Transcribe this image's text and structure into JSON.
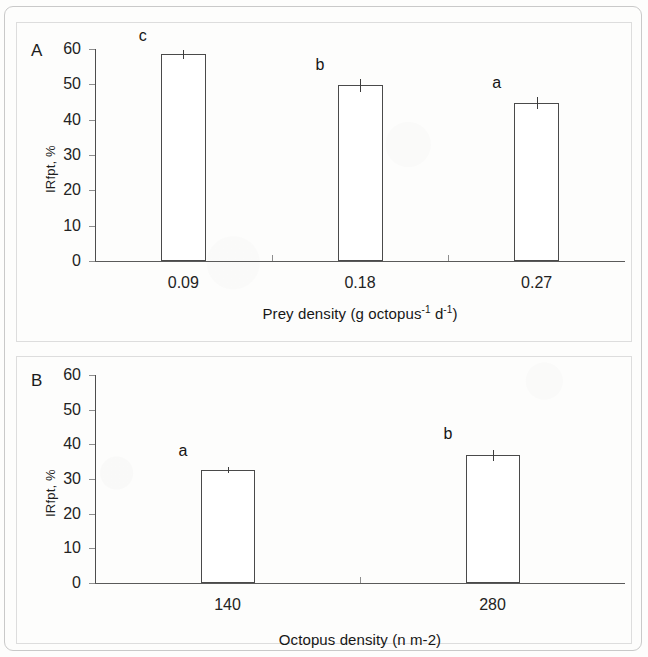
{
  "figure": {
    "panel_a_letter": "A",
    "panel_b_letter": "B"
  },
  "chart_data": [
    {
      "type": "bar",
      "panel": "A",
      "title": "",
      "xlabel": "Prey density (g octopus-1 d-1)",
      "xlabel_parts": {
        "prefix": "Prey density (g octopus",
        "sup1": "-1",
        "middle": " d",
        "sup2": "-1",
        "suffix": ")"
      },
      "ylabel": "IRfpt, %",
      "categories": [
        "0.09",
        "0.18",
        "0.27"
      ],
      "values": [
        58.5,
        49.7,
        44.7
      ],
      "errors": [
        1.2,
        1.8,
        1.7
      ],
      "point_labels": [
        "c",
        "b",
        "a"
      ],
      "ylim": [
        0,
        60
      ],
      "yticks": [
        0,
        10,
        20,
        30,
        40,
        50,
        60
      ],
      "ytick_labels": [
        "0",
        "10",
        "20",
        "30",
        "40",
        "50",
        "60"
      ],
      "grid": false,
      "legend": "none",
      "bar_fill": "#ffffff",
      "bar_edge": "#4a4a4a"
    },
    {
      "type": "bar",
      "panel": "B",
      "title": "",
      "xlabel": "Octopus density (n m-2)",
      "ylabel": "IRfpt, %",
      "categories": [
        "140",
        "280"
      ],
      "values": [
        32.6,
        36.8
      ],
      "errors": [
        1.0,
        1.5
      ],
      "point_labels": [
        "a",
        "b"
      ],
      "ylim": [
        0,
        60
      ],
      "yticks": [
        0,
        10,
        20,
        30,
        40,
        50,
        60
      ],
      "ytick_labels": [
        "0",
        "10",
        "20",
        "30",
        "40",
        "50",
        "60"
      ],
      "grid": false,
      "legend": "none",
      "bar_fill": "#ffffff",
      "bar_edge": "#4a4a4a"
    }
  ]
}
